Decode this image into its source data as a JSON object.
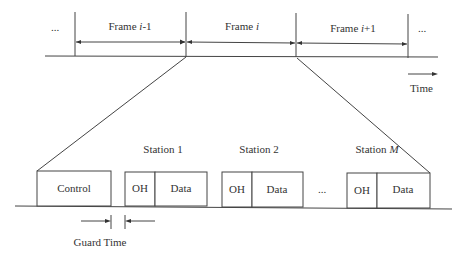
{
  "diagram": {
    "type": "tdma-frame-structure",
    "top": {
      "ellipsis_left": "...",
      "ellipsis_right": "...",
      "frames": [
        {
          "prefix": "Frame ",
          "var": "i",
          "suffix": "-1"
        },
        {
          "prefix": "Frame ",
          "var": "i",
          "suffix": ""
        },
        {
          "prefix": "Frame ",
          "var": "i",
          "suffix": "+1"
        }
      ],
      "time_label": "Time"
    },
    "bottom": {
      "control_label": "Control",
      "stations": [
        {
          "prefix": "Station ",
          "var": "",
          "num": "1",
          "oh": "OH",
          "data": "Data"
        },
        {
          "prefix": "Station ",
          "var": "",
          "num": "2",
          "oh": "OH",
          "data": "Data"
        },
        {
          "prefix": "Station ",
          "var": "M",
          "num": "",
          "oh": "OH",
          "data": "Data"
        }
      ],
      "ellipsis_mid": "...",
      "guard_time_label": "Guard Time"
    }
  }
}
